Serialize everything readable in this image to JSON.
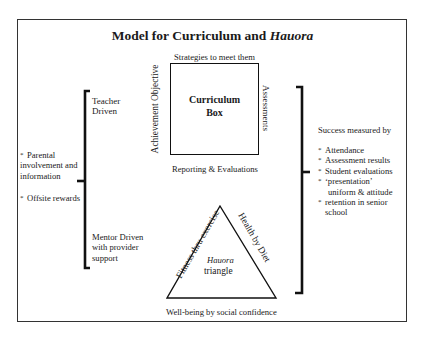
{
  "title": {
    "main": "Model for Curriculum and ",
    "italic": "Hauora"
  },
  "curriculum_box": {
    "top_label": "Strategies to meet them",
    "left_label": "Achievement Objective",
    "right_label": "Assessments",
    "bottom_label": "Reporting & Evaluations",
    "center_line1": "Curriculum",
    "center_line2": "Box"
  },
  "left_bracket": {
    "top_label_line1": "Teacher",
    "top_label_line2": "Driven",
    "bottom_label_line1": "Mentor Driven",
    "bottom_label_line2": "with provider",
    "bottom_label_line3": "support"
  },
  "left_notes": [
    {
      "bullet": "*",
      "lines": [
        "Parental",
        "involvement and",
        "information"
      ]
    },
    {
      "bullet": "*",
      "lines": [
        "Offsite rewards"
      ]
    }
  ],
  "success": {
    "heading": "Success measured by",
    "items": [
      {
        "bullet": "*",
        "text": "Attendance"
      },
      {
        "bullet": "*",
        "text": "Assessment results"
      },
      {
        "bullet": "*",
        "text": "Student evaluations"
      },
      {
        "bullet": "*",
        "text": "‘presentation’",
        "text2": "uniform & attitude"
      },
      {
        "bullet": "*",
        "text": "retention in senior",
        "text2": "school"
      }
    ]
  },
  "hauora_triangle": {
    "left_side": "Fitness thru exercise",
    "right_side": "Health by Diet",
    "bottom": "Well-being by social confidence",
    "center_line1": "Hauora",
    "center_line2": "triangle"
  },
  "colors": {
    "line": "#111111",
    "text": "#1a1a1a",
    "background": "#ffffff"
  }
}
